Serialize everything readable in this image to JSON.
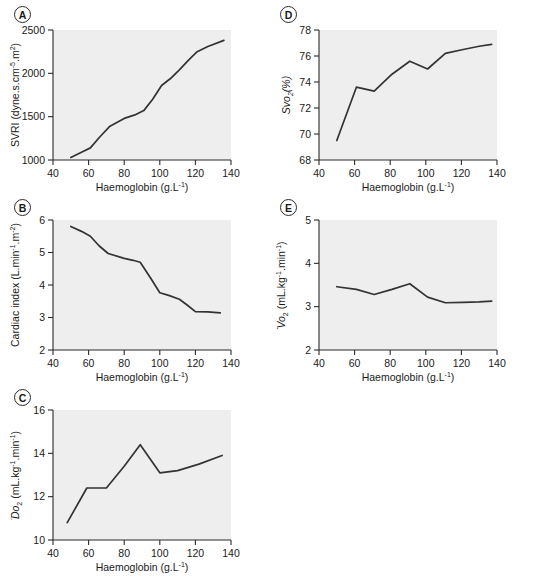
{
  "figure": {
    "background_color": "#ffffff",
    "plot_area_color": "#eeeeee",
    "line_color": "#333333",
    "axis_color": "#2b2b2b",
    "x_axis_label_main": "Haemoglobin (g.L",
    "x_axis_label_sup": "-1",
    "x_axis_label_tail": ")"
  },
  "panels": [
    {
      "tag": "A",
      "ylabel_parts": [
        "SVRI (dyne.s.cm",
        "-5",
        ".m",
        "2",
        ")"
      ],
      "xticks": [
        "40",
        "60",
        "80",
        "100",
        "120",
        "140"
      ],
      "yticks": [
        "1000",
        "1500",
        "2000",
        "2500"
      ]
    },
    {
      "tag": "B",
      "ylabel_parts": [
        "Cardiac index (L.min",
        "-1",
        ".m",
        "-2",
        ")"
      ],
      "xticks": [
        "40",
        "60",
        "80",
        "100",
        "120",
        "140"
      ],
      "yticks": [
        "2",
        "3",
        "4",
        "5",
        "6"
      ]
    },
    {
      "tag": "C",
      "ylabel_parts": [
        "Do",
        "2",
        " (mL.kg",
        "-1",
        ".min",
        "-1",
        ")"
      ],
      "xticks": [
        "40",
        "60",
        "80",
        "100",
        "120",
        "140"
      ],
      "yticks": [
        "10",
        "12",
        "14",
        "16"
      ]
    },
    {
      "tag": "D",
      "ylabel_parts": [
        "Svo",
        "2",
        "(%)"
      ],
      "xticks": [
        "40",
        "60",
        "80",
        "100",
        "120",
        "140"
      ],
      "yticks": [
        "68",
        "70",
        "72",
        "74",
        "76",
        "78"
      ]
    },
    {
      "tag": "E",
      "ylabel_parts": [
        "Vo",
        "2",
        " (mL.kg",
        "-1",
        ".min",
        "-1",
        ")"
      ],
      "xticks": [
        "40",
        "60",
        "80",
        "100",
        "120",
        "140"
      ],
      "yticks": [
        "2",
        "3",
        "4",
        "5"
      ]
    }
  ],
  "chart_data": [
    {
      "id": "panel-a",
      "type": "line",
      "title": "A",
      "xlabel": "Haemoglobin (g.L-1)",
      "ylabel": "SVRI (dyne.s.cm-5.m2)",
      "xlim": [
        40,
        140
      ],
      "ylim": [
        1000,
        2500
      ],
      "xticks": [
        40,
        60,
        80,
        100,
        120,
        140
      ],
      "yticks": [
        1000,
        1500,
        2000,
        2500
      ],
      "grid": false,
      "legend": null,
      "x": [
        50,
        56,
        61,
        66,
        72,
        80,
        86,
        91,
        96,
        101,
        106,
        111,
        116,
        121,
        127,
        136
      ],
      "y": [
        1030,
        1090,
        1140,
        1260,
        1390,
        1480,
        1520,
        1570,
        1700,
        1860,
        1940,
        2040,
        2150,
        2250,
        2310,
        2380
      ]
    },
    {
      "id": "panel-b",
      "type": "line",
      "title": "B",
      "xlabel": "Haemoglobin (g.L-1)",
      "ylabel": "Cardiac index (L.min-1.m-2)",
      "xlim": [
        40,
        140
      ],
      "ylim": [
        2,
        6
      ],
      "xticks": [
        40,
        60,
        80,
        100,
        120,
        140
      ],
      "yticks": [
        2,
        3,
        4,
        5,
        6
      ],
      "grid": false,
      "legend": null,
      "x": [
        50,
        56,
        61,
        66,
        71,
        80,
        85,
        89,
        95,
        100,
        105,
        111,
        115,
        120,
        127,
        134
      ],
      "y": [
        5.8,
        5.65,
        5.5,
        5.2,
        4.97,
        4.82,
        4.76,
        4.7,
        4.2,
        3.76,
        3.68,
        3.56,
        3.4,
        3.18,
        3.17,
        3.14
      ]
    },
    {
      "id": "panel-c",
      "type": "line",
      "title": "C",
      "xlabel": "Haemoglobin (g.L-1)",
      "ylabel": "Do2 (mL.kg-1.min-1)",
      "xlim": [
        40,
        140
      ],
      "ylim": [
        10,
        16
      ],
      "xticks": [
        40,
        60,
        80,
        100,
        120,
        140
      ],
      "yticks": [
        10,
        12,
        14,
        16
      ],
      "grid": false,
      "legend": null,
      "x": [
        48,
        59,
        70,
        80,
        89,
        100,
        110,
        122,
        135
      ],
      "y": [
        10.8,
        12.4,
        12.4,
        13.4,
        14.4,
        13.1,
        13.2,
        13.5,
        13.9
      ]
    },
    {
      "id": "panel-d",
      "type": "line",
      "title": "D",
      "xlabel": "Haemoglobin (g.L-1)",
      "ylabel": "Svo2(%)",
      "xlim": [
        40,
        140
      ],
      "ylim": [
        68,
        78
      ],
      "xticks": [
        40,
        60,
        80,
        100,
        120,
        140
      ],
      "yticks": [
        68,
        70,
        72,
        74,
        76,
        78
      ],
      "grid": false,
      "legend": null,
      "x": [
        50,
        61,
        71,
        81,
        91,
        101,
        111,
        121,
        130,
        137
      ],
      "y": [
        69.5,
        73.6,
        73.3,
        74.6,
        75.6,
        75.0,
        76.2,
        76.5,
        76.75,
        76.9
      ]
    },
    {
      "id": "panel-e",
      "type": "line",
      "title": "E",
      "xlabel": "Haemoglobin (g.L-1)",
      "ylabel": "Vo2 (mL.kg-1.min-1)",
      "xlim": [
        40,
        140
      ],
      "ylim": [
        2,
        5
      ],
      "xticks": [
        40,
        60,
        80,
        100,
        120,
        140
      ],
      "yticks": [
        2,
        3,
        4,
        5
      ],
      "grid": false,
      "legend": null,
      "x": [
        50,
        61,
        71,
        81,
        91,
        101,
        111,
        121,
        130,
        137
      ],
      "y": [
        3.46,
        3.4,
        3.28,
        3.4,
        3.53,
        3.22,
        3.09,
        3.1,
        3.11,
        3.13
      ]
    }
  ]
}
